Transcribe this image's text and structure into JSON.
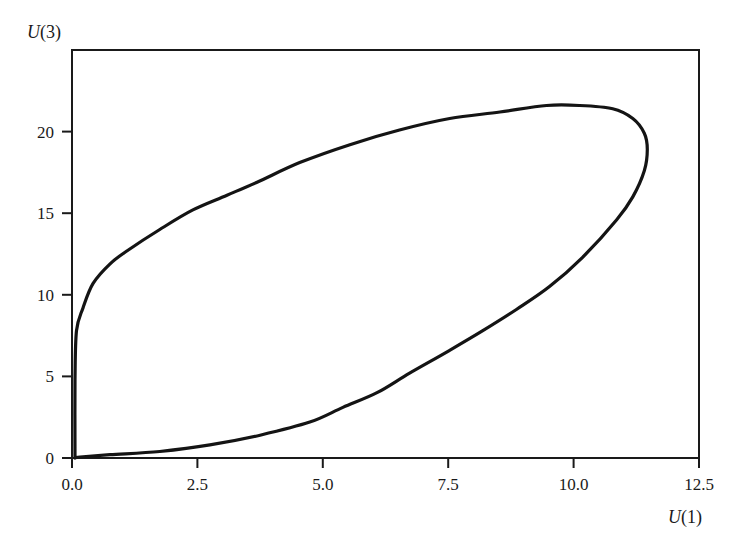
{
  "chart_data": {
    "type": "line",
    "title": "",
    "xlabel": "U(1)",
    "ylabel": "U(3)",
    "xlabel_parts": {
      "var": "U",
      "arg": "(1)"
    },
    "ylabel_parts": {
      "var": "U",
      "arg": "(3)"
    },
    "xlim": [
      0,
      12.5
    ],
    "ylim": [
      0,
      25
    ],
    "xticks": [
      0.0,
      2.5,
      5.0,
      7.5,
      10.0,
      12.5
    ],
    "xtick_labels": [
      "0.0",
      "2.5",
      "5.0",
      "7.5",
      "10.0",
      "12.5"
    ],
    "yticks": [
      0,
      5,
      10,
      15,
      20
    ],
    "ytick_labels": [
      "0",
      "5",
      "10",
      "15",
      "20"
    ],
    "grid": false,
    "legend": null,
    "frame": "box",
    "series": [
      {
        "name": "trajectory",
        "closed": true,
        "color": "#141414",
        "points": [
          [
            0.06,
            0.0
          ],
          [
            0.06,
            4.8
          ],
          [
            0.09,
            7.8
          ],
          [
            0.22,
            9.2
          ],
          [
            0.42,
            10.7
          ],
          [
            0.76,
            11.9
          ],
          [
            1.1,
            12.7
          ],
          [
            1.75,
            14.0
          ],
          [
            2.41,
            15.2
          ],
          [
            3.09,
            16.1
          ],
          [
            3.69,
            16.9
          ],
          [
            4.54,
            18.1
          ],
          [
            5.54,
            19.2
          ],
          [
            6.53,
            20.1
          ],
          [
            7.53,
            20.8
          ],
          [
            8.53,
            21.2
          ],
          [
            9.46,
            21.6
          ],
          [
            10.12,
            21.6
          ],
          [
            10.78,
            21.4
          ],
          [
            11.18,
            20.8
          ],
          [
            11.41,
            19.9
          ],
          [
            11.47,
            18.9
          ],
          [
            11.41,
            17.6
          ],
          [
            11.18,
            16.0
          ],
          [
            10.86,
            14.6
          ],
          [
            10.18,
            12.3
          ],
          [
            9.52,
            10.5
          ],
          [
            8.86,
            9.1
          ],
          [
            8.19,
            7.8
          ],
          [
            7.53,
            6.6
          ],
          [
            6.73,
            5.2
          ],
          [
            6.08,
            4.0
          ],
          [
            5.4,
            3.1
          ],
          [
            4.74,
            2.2
          ],
          [
            3.75,
            1.4
          ],
          [
            2.75,
            0.8
          ],
          [
            1.75,
            0.4
          ],
          [
            0.76,
            0.2
          ],
          [
            0.16,
            0.06
          ],
          [
            0.06,
            0.0
          ]
        ]
      }
    ]
  }
}
